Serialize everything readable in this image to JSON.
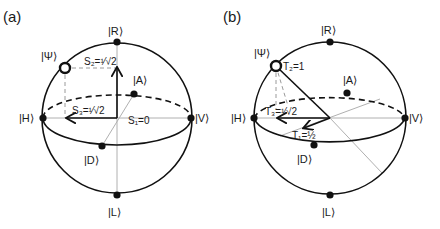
{
  "figure": {
    "panels": [
      {
        "id": "a",
        "label": "(a)",
        "states": {
          "R": "|R⟩",
          "L": "|L⟩",
          "H": "|H⟩",
          "V": "|V⟩",
          "D": "|D⟩",
          "A": "|A⟩",
          "Psi": "|Ψ⟩"
        },
        "components": {
          "s1": "S₁=0",
          "s2": "S₂=½√2",
          "s2_display": "S₂=¹⁄√2",
          "s3_display": "S₃=¹⁄√2"
        }
      },
      {
        "id": "b",
        "label": "(b)",
        "states": {
          "R": "|R⟩",
          "L": "|L⟩",
          "H": "|H⟩",
          "V": "|V⟩",
          "D": "|D⟩",
          "A": "|A⟩",
          "Psi": "|Ψ⟩"
        },
        "components": {
          "t1_display": "T₁=½",
          "t2_display": "T₂=1",
          "t3_display": "T₃=¹⁄√2"
        }
      }
    ],
    "colors": {
      "line": "#111111",
      "axis": "#b0b0b0",
      "guide": "#9a9a9a"
    }
  }
}
